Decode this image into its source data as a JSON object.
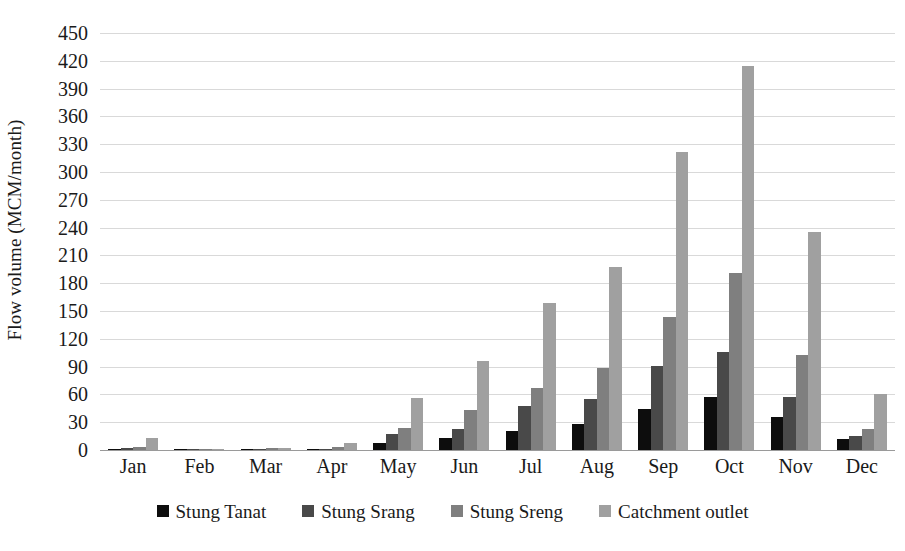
{
  "chart_data": {
    "type": "bar",
    "title": "",
    "xlabel": "",
    "ylabel": "Flow volume (MCM/month)",
    "ylim": [
      0,
      450
    ],
    "ytick_step": 30,
    "yticks": [
      0,
      30,
      60,
      90,
      120,
      150,
      180,
      210,
      240,
      270,
      300,
      330,
      360,
      390,
      420,
      450
    ],
    "grid": true,
    "legend_position": "bottom",
    "categories": [
      "Jan",
      "Feb",
      "Mar",
      "Apr",
      "May",
      "Jun",
      "Jul",
      "Aug",
      "Sep",
      "Oct",
      "Nov",
      "Dec"
    ],
    "series": [
      {
        "name": "Stung Tanat",
        "color": "#0d0d0d",
        "values": [
          1,
          0,
          0,
          1,
          8,
          13,
          21,
          28,
          44,
          57,
          36,
          12
        ]
      },
      {
        "name": "Stung Srang",
        "color": "#494949",
        "values": [
          2,
          0,
          0,
          1,
          17,
          23,
          48,
          55,
          91,
          106,
          57,
          15
        ]
      },
      {
        "name": "Stung Sreng",
        "color": "#7f7f7f",
        "values": [
          3,
          1,
          2,
          3,
          24,
          43,
          67,
          89,
          144,
          191,
          102,
          23
        ]
      },
      {
        "name": "Catchment outlet",
        "color": "#a0a0a0",
        "values": [
          13,
          1,
          2,
          8,
          56,
          96,
          159,
          198,
          322,
          414,
          235,
          60
        ]
      }
    ]
  },
  "colors": {
    "gridline": "#d9d9d9",
    "axis": "#9a9a9a",
    "text": "#1a1a1a",
    "background": "#ffffff"
  }
}
